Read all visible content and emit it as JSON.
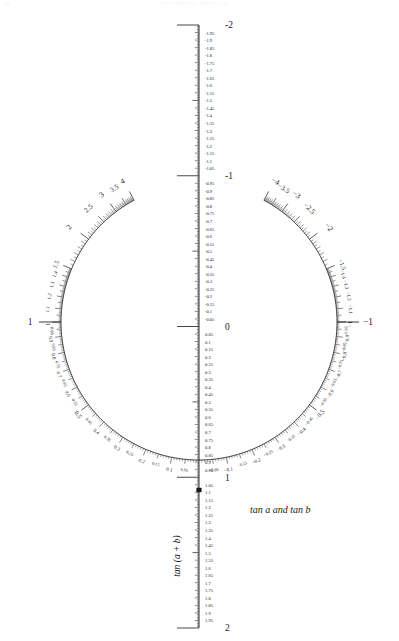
{
  "page": {
    "corner_note": "208",
    "header_note": "TRIGONOMETRIC NOMOGRAM"
  },
  "labels": {
    "vertical_axis_label": "tan (a + b)",
    "arc_label": "tan a and tan b"
  },
  "colors": {
    "ink": "#1a1a1a",
    "rule": "#2b2b2b",
    "background": "#ffffff"
  },
  "chart_data": {
    "type": "nomogram",
    "center": {
      "x": 199,
      "y": 322
    },
    "radius": 138,
    "axes": [
      {
        "name": "vertical",
        "label": "tan (a + b)",
        "orientation": "vertical",
        "range": [
          -2,
          2
        ],
        "top_value": -2,
        "bottom_value": 2,
        "zero_value": 0,
        "x_pixel": 199,
        "y_top_pixel": 25,
        "y_bottom_pixel": 628,
        "minor_step": 0.01,
        "mid_step": 0.05,
        "major_step": 0.5,
        "endpoint_labels": [
          "-2",
          "-1",
          "0",
          "1",
          "2"
        ],
        "tick_labels": [
          "-2",
          "-1.95",
          "-1.9",
          "-1.85",
          "-1.8",
          "-1.75",
          "-1.7",
          "-1.65",
          "-1.6",
          "-1.55",
          "-1.5",
          "-1.45",
          "-1.4",
          "-1.35",
          "-1.3",
          "-1.25",
          "-1.2",
          "-1.15",
          "-1.1",
          "-1.05",
          "-1",
          "-0.95",
          "-0.9",
          "-0.85",
          "-0.8",
          "-0.75",
          "-0.7",
          "-0.65",
          "-0.6",
          "-0.55",
          "-0.5",
          "-0.45",
          "-0.4",
          "-0.35",
          "-0.3",
          "-0.25",
          "-0.2",
          "-0.15",
          "-0.1",
          "-0.05",
          "0",
          "0.05",
          "0.1",
          "0.15",
          "0.2",
          "0.25",
          "0.3",
          "0.35",
          "0.4",
          "0.45",
          "0.5",
          "0.55",
          "0.6",
          "0.65",
          "0.7",
          "0.75",
          "0.8",
          "0.85",
          "0.9",
          "0.95",
          "1",
          "1.05",
          "1.1",
          "1.15",
          "1.2",
          "1.25",
          "1.3",
          "1.35",
          "1.4",
          "1.45",
          "1.5",
          "1.55",
          "1.6",
          "1.65",
          "1.7",
          "1.75",
          "1.8",
          "1.85",
          "1.9",
          "1.95",
          "2"
        ]
      },
      {
        "name": "left-arc",
        "label": "tan a and tan b",
        "sign": "positive",
        "side": "left",
        "values_low_to_high": [
          0.05,
          4
        ],
        "labeled_fine": [
          "0.05",
          "0.1",
          "0.15",
          "0.2",
          "0.25",
          "0.3",
          "0.35",
          "0.4",
          "0.45",
          "0.5",
          "0.55",
          "0.6",
          "0.65",
          "0.7",
          "0.75",
          "0.8",
          "0.85",
          "0.9",
          "0.95",
          "1",
          "1.1",
          "1.2",
          "1.3",
          "1.4",
          "1.5"
        ],
        "labeled_coarse": [
          "2",
          "2.5",
          "3",
          "3.5",
          "4"
        ],
        "value_at_horizontal": 1,
        "value_at_bottom": 0
      },
      {
        "name": "right-arc",
        "label": "tan a and tan b",
        "sign": "negative",
        "side": "right",
        "values_low_to_high": [
          -0.05,
          -4
        ],
        "labeled_fine": [
          "-0.05",
          "-0.1",
          "-0.15",
          "-0.2",
          "-0.25",
          "-0.3",
          "-0.35",
          "-0.4",
          "-0.45",
          "-0.5",
          "-0.55",
          "-0.6",
          "-0.65",
          "-0.7",
          "-0.75",
          "-0.8",
          "-0.85",
          "-0.9",
          "-0.95",
          "-1",
          "-1.1",
          "-1.2",
          "-1.3",
          "-1.4",
          "-1.5"
        ],
        "labeled_coarse": [
          "-2",
          "-2.5",
          "-3",
          "-3.5",
          "-4"
        ],
        "value_at_horizontal": -1,
        "value_at_bottom": 0
      }
    ],
    "markers": [
      {
        "name": "axis-origin-marker",
        "axis": "vertical",
        "value": 1.05,
        "x": 199,
        "y": 490
      }
    ]
  }
}
